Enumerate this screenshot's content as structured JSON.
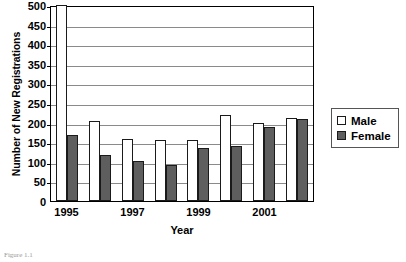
{
  "chart_data": {
    "type": "bar",
    "title": "",
    "xlabel": "Year",
    "ylabel": "Number of New Registrations",
    "categories": [
      "1995",
      "1996",
      "1997",
      "1998",
      "1999",
      "2000",
      "2001",
      "2002"
    ],
    "tick_labels": [
      "1995",
      "1997",
      "1999",
      "2001"
    ],
    "series": [
      {
        "name": "Male",
        "values": [
          500,
          203,
          157,
          156,
          155,
          220,
          200,
          212
        ]
      },
      {
        "name": "Female",
        "values": [
          168,
          117,
          103,
          91,
          135,
          140,
          188,
          210
        ]
      }
    ],
    "ylim": [
      0,
      500
    ],
    "yticks": [
      0,
      50,
      100,
      150,
      200,
      250,
      300,
      350,
      400,
      450,
      500
    ],
    "grid": true,
    "legend_position": "right"
  },
  "legend": {
    "items": [
      {
        "label": "Male",
        "color": "#ffffff"
      },
      {
        "label": "Female",
        "color": "#5e5e5e"
      }
    ]
  },
  "caption": "Figure 1.1"
}
